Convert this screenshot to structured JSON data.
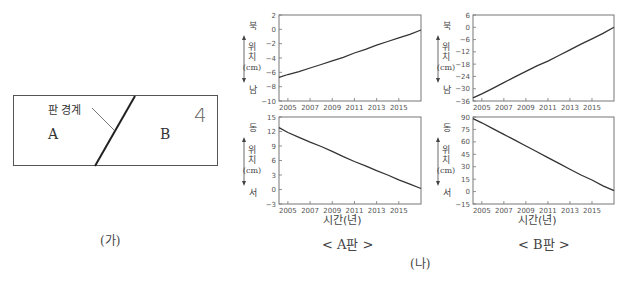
{
  "figure_ga": {
    "boundary_label": "판 경계",
    "plate_a": "A",
    "plate_b": "B",
    "annotation": "4",
    "caption": "(가)"
  },
  "figure_na": {
    "caption": "(나)",
    "panel_a_caption": "< A판 >",
    "panel_b_caption": "< B판 >",
    "xlabel": "시간(년)"
  },
  "chart_data": [
    {
      "id": "A-north-south",
      "type": "line",
      "title": "A판 남북 위치",
      "xlabel": "",
      "ylabel": "위치 (cm)",
      "y_top_label": "북",
      "y_bottom_label": "남",
      "x": [
        2004.2,
        2005,
        2006,
        2007,
        2008,
        2009,
        2010,
        2011,
        2012,
        2013,
        2014,
        2015,
        2016,
        2017
      ],
      "values": [
        -6.7,
        -6.3,
        -5.9,
        -5.4,
        -4.9,
        -4.4,
        -3.9,
        -3.3,
        -2.8,
        -2.2,
        -1.7,
        -1.2,
        -0.7,
        -0.1
      ],
      "xlim": [
        2004.2,
        2017
      ],
      "ylim": [
        -10,
        2
      ],
      "yticks": [
        -10,
        -8,
        -6,
        -4,
        -2,
        0,
        2
      ],
      "xticks": [
        "2005",
        "2007",
        "2009",
        "2011",
        "2013",
        "2015"
      ]
    },
    {
      "id": "A-east-west",
      "type": "line",
      "title": "A판 동서 위치",
      "xlabel": "시간(년)",
      "ylabel": "위치 (cm)",
      "y_top_label": "동",
      "y_bottom_label": "서",
      "x": [
        2004.2,
        2005,
        2006,
        2007,
        2008,
        2009,
        2010,
        2011,
        2012,
        2013,
        2014,
        2015,
        2016,
        2017
      ],
      "values": [
        12.8,
        11.8,
        10.8,
        9.8,
        8.9,
        7.9,
        6.8,
        5.8,
        4.9,
        3.9,
        3.0,
        2.0,
        1.1,
        0.2
      ],
      "xlim": [
        2004.2,
        2017
      ],
      "ylim": [
        -3,
        15
      ],
      "yticks": [
        -3,
        0,
        3,
        6,
        9,
        12,
        15
      ],
      "xticks": [
        "2005",
        "2007",
        "2009",
        "2011",
        "2013",
        "2015"
      ]
    },
    {
      "id": "B-north-south",
      "type": "line",
      "title": "B판 남북 위치",
      "xlabel": "",
      "ylabel": "위치 (cm)",
      "y_top_label": "북",
      "y_bottom_label": "남",
      "x": [
        2004.2,
        2005,
        2006,
        2007,
        2008,
        2009,
        2010,
        2011,
        2012,
        2013,
        2014,
        2015,
        2016,
        2017
      ],
      "values": [
        -34.5,
        -32.5,
        -29.8,
        -27,
        -24.2,
        -21.5,
        -18.8,
        -16.5,
        -13.8,
        -11,
        -8.2,
        -5.6,
        -3,
        0
      ],
      "xlim": [
        2004.2,
        2017
      ],
      "ylim": [
        -36,
        6
      ],
      "yticks": [
        -36,
        -30,
        -24,
        -18,
        -12,
        -6,
        0,
        6
      ],
      "xticks": [
        "2005",
        "2007",
        "2009",
        "2011",
        "2013",
        "2015"
      ]
    },
    {
      "id": "B-east-west",
      "type": "line",
      "title": "B판 동서 위치",
      "xlabel": "시간(년)",
      "ylabel": "위치 (cm)",
      "y_top_label": "동",
      "y_bottom_label": "서",
      "x": [
        2004.2,
        2005,
        2006,
        2007,
        2008,
        2009,
        2010,
        2011,
        2012,
        2013,
        2014,
        2015,
        2016,
        2017
      ],
      "values": [
        88,
        83,
        76,
        69,
        62,
        55,
        48,
        41,
        34,
        27,
        20,
        14,
        7,
        1
      ],
      "xlim": [
        2004.2,
        2017
      ],
      "ylim": [
        -15,
        90
      ],
      "yticks": [
        -15,
        0,
        15,
        30,
        45,
        60,
        75,
        90
      ],
      "xticks": [
        "2005",
        "2007",
        "2009",
        "2011",
        "2013",
        "2015"
      ]
    }
  ],
  "layout": {
    "panels": [
      {
        "x0": 279,
        "x1": 421,
        "y0": 15,
        "y1": 101
      },
      {
        "x0": 279,
        "x1": 421,
        "y0": 117,
        "y1": 204
      },
      {
        "x0": 473,
        "x1": 614,
        "y0": 15,
        "y1": 101
      },
      {
        "x0": 473,
        "x1": 614,
        "y0": 117,
        "y1": 204
      }
    ],
    "ylabel_chars": [
      "위",
      "치",
      "(cm)"
    ],
    "line_color": "#333333",
    "axis_color": "#777777"
  }
}
